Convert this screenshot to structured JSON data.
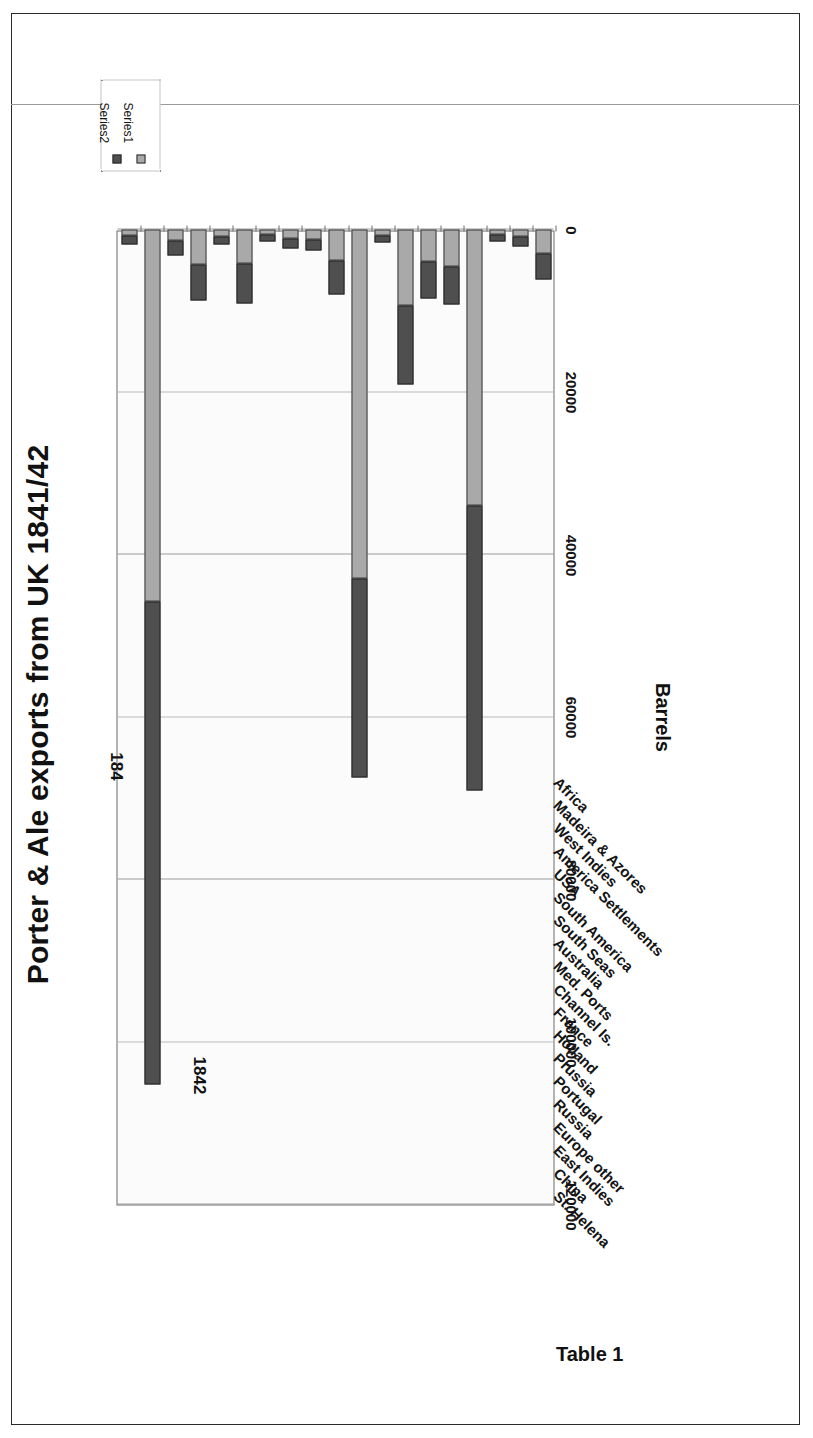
{
  "document": {
    "caption": "Table 1"
  },
  "chart_data": {
    "type": "bar",
    "orientation": "horizontal",
    "stacked": true,
    "title": "Porter & Ale exports from UK 1841/42",
    "xlabel": "",
    "ylabel": "Barrels",
    "axis_title": "Barrels",
    "grid": true,
    "legend_position": "bottom-left",
    "value_axis": {
      "min": 0,
      "max": 120000,
      "step": 20000,
      "ticks": [
        120000,
        100000,
        80000,
        60000,
        40000,
        20000,
        0
      ],
      "tick_labels": [
        "120000",
        "100000",
        "80000",
        "60000",
        "40000",
        "20000",
        "0"
      ],
      "direction": "right-to-left"
    },
    "categories": [
      "St. Helena",
      "China",
      "East Indies",
      "Europe other",
      "Russia",
      "Portugal",
      "Prussia",
      "Holland",
      "France",
      "Channel Is.",
      "Med. Ports",
      "Australia",
      "South Seas",
      "South America",
      "USA",
      "America Settlements",
      "West Indies",
      "Madeira & Azores",
      "Africa"
    ],
    "series": [
      {
        "name": "Series1",
        "label": "Series1",
        "color": "#a9a9a9",
        "year": "184",
        "values": [
          700,
          45800,
          1300,
          4300,
          900,
          4200,
          600,
          1100,
          1200,
          3800,
          43000,
          700,
          9300,
          4000,
          4500,
          34000,
          600,
          900,
          2900
        ]
      },
      {
        "name": "Series2",
        "label": "Series2",
        "color": "#4f4f4f",
        "year": "1842",
        "values": [
          1100,
          59400,
          1900,
          4500,
          1000,
          4900,
          900,
          1300,
          1400,
          4200,
          24500,
          900,
          9800,
          4500,
          4700,
          35000,
          900,
          1200,
          3200
        ]
      }
    ],
    "annotations": [
      {
        "text": "1842",
        "series": "Series2"
      },
      {
        "text": "184",
        "series": "Series1"
      }
    ],
    "legend": {
      "entries": [
        {
          "label": "Series2",
          "color": "#4f4f4f"
        },
        {
          "label": "Series1",
          "color": "#a9a9a9"
        }
      ]
    }
  }
}
